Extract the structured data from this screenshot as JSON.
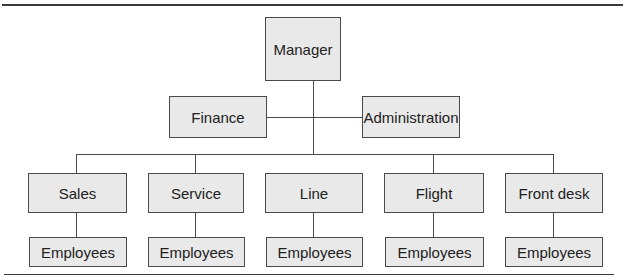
{
  "chart": {
    "top": {
      "manager": "Manager"
    },
    "staff": {
      "left": "Finance",
      "right": "Administration"
    },
    "departments": [
      {
        "label": "Sales",
        "employees": "Employees"
      },
      {
        "label": "Service",
        "employees": "Employees"
      },
      {
        "label": "Line",
        "employees": "Employees"
      },
      {
        "label": "Flight",
        "employees": "Employees"
      },
      {
        "label": "Front desk",
        "employees": "Employees"
      }
    ]
  },
  "colors": {
    "box_fill": "#e9e9e9",
    "line": "#4a4a4a",
    "rule": "#3a3a3a"
  }
}
